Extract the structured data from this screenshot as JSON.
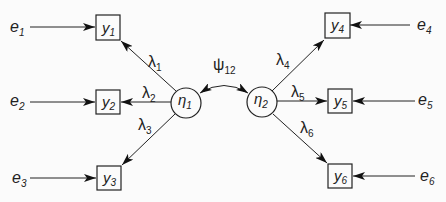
{
  "diagram": {
    "type": "structural-equation-model",
    "latent_variables": [
      {
        "id": "eta1",
        "symbol": "η",
        "subscript": "1"
      },
      {
        "id": "eta2",
        "symbol": "η",
        "subscript": "2"
      }
    ],
    "observed_variables": [
      {
        "id": "y1",
        "symbol": "y",
        "subscript": "1",
        "factor": "eta1"
      },
      {
        "id": "y2",
        "symbol": "y",
        "subscript": "2",
        "factor": "eta1"
      },
      {
        "id": "y3",
        "symbol": "y",
        "subscript": "3",
        "factor": "eta1"
      },
      {
        "id": "y4",
        "symbol": "y",
        "subscript": "4",
        "factor": "eta2"
      },
      {
        "id": "y5",
        "symbol": "y",
        "subscript": "5",
        "factor": "eta2"
      },
      {
        "id": "y6",
        "symbol": "y",
        "subscript": "6",
        "factor": "eta2"
      }
    ],
    "errors": [
      {
        "id": "e1",
        "symbol": "e",
        "subscript": "1",
        "target": "y1"
      },
      {
        "id": "e2",
        "symbol": "e",
        "subscript": "2",
        "target": "y2"
      },
      {
        "id": "e3",
        "symbol": "e",
        "subscript": "3",
        "target": "y3"
      },
      {
        "id": "e4",
        "symbol": "e",
        "subscript": "4",
        "target": "y4"
      },
      {
        "id": "e5",
        "symbol": "e",
        "subscript": "5",
        "target": "y5"
      },
      {
        "id": "e6",
        "symbol": "e",
        "subscript": "6",
        "target": "y6"
      }
    ],
    "loadings": [
      {
        "symbol": "λ",
        "subscript": "1",
        "from": "eta1",
        "to": "y1"
      },
      {
        "symbol": "λ",
        "subscript": "2",
        "from": "eta1",
        "to": "y2"
      },
      {
        "symbol": "λ",
        "subscript": "3",
        "from": "eta1",
        "to": "y3"
      },
      {
        "symbol": "λ",
        "subscript": "4",
        "from": "eta2",
        "to": "y4"
      },
      {
        "symbol": "λ",
        "subscript": "5",
        "from": "eta2",
        "to": "y5"
      },
      {
        "symbol": "λ",
        "subscript": "6",
        "from": "eta2",
        "to": "y6"
      }
    ],
    "covariance": {
      "symbol": "ψ",
      "subscript": "12",
      "between": [
        "eta1",
        "eta2"
      ]
    }
  }
}
